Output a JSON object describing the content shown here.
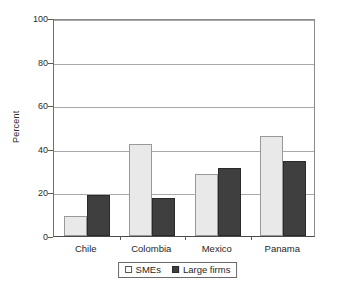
{
  "chart_data": {
    "type": "bar",
    "title": "",
    "xlabel": "",
    "ylabel": "Percent",
    "categories": [
      "Chile",
      "Colombia",
      "Mexico",
      "Panama"
    ],
    "series": [
      {
        "name": "SMEs",
        "values": [
          9,
          42,
          28.5,
          46
        ],
        "color": "#e9e9e9"
      },
      {
        "name": "Large firms",
        "values": [
          19,
          17.5,
          31,
          34.5
        ],
        "color": "#3f3f3f"
      }
    ],
    "ylim": [
      0,
      100
    ],
    "ytick_values": [
      0,
      20,
      40,
      60,
      80,
      100
    ],
    "ytick_labels": [
      "0",
      "20",
      "40",
      "60",
      "80",
      "100"
    ],
    "grid": true,
    "grid_axis": "y",
    "legend_position": "bottom-center",
    "legend_entries": [
      "SMEs",
      "Large firms"
    ],
    "frame": true
  },
  "axes": {
    "y_title": "Percent"
  },
  "legend": {
    "items": [
      {
        "label": "SMEs"
      },
      {
        "label": "Large firms"
      }
    ]
  }
}
